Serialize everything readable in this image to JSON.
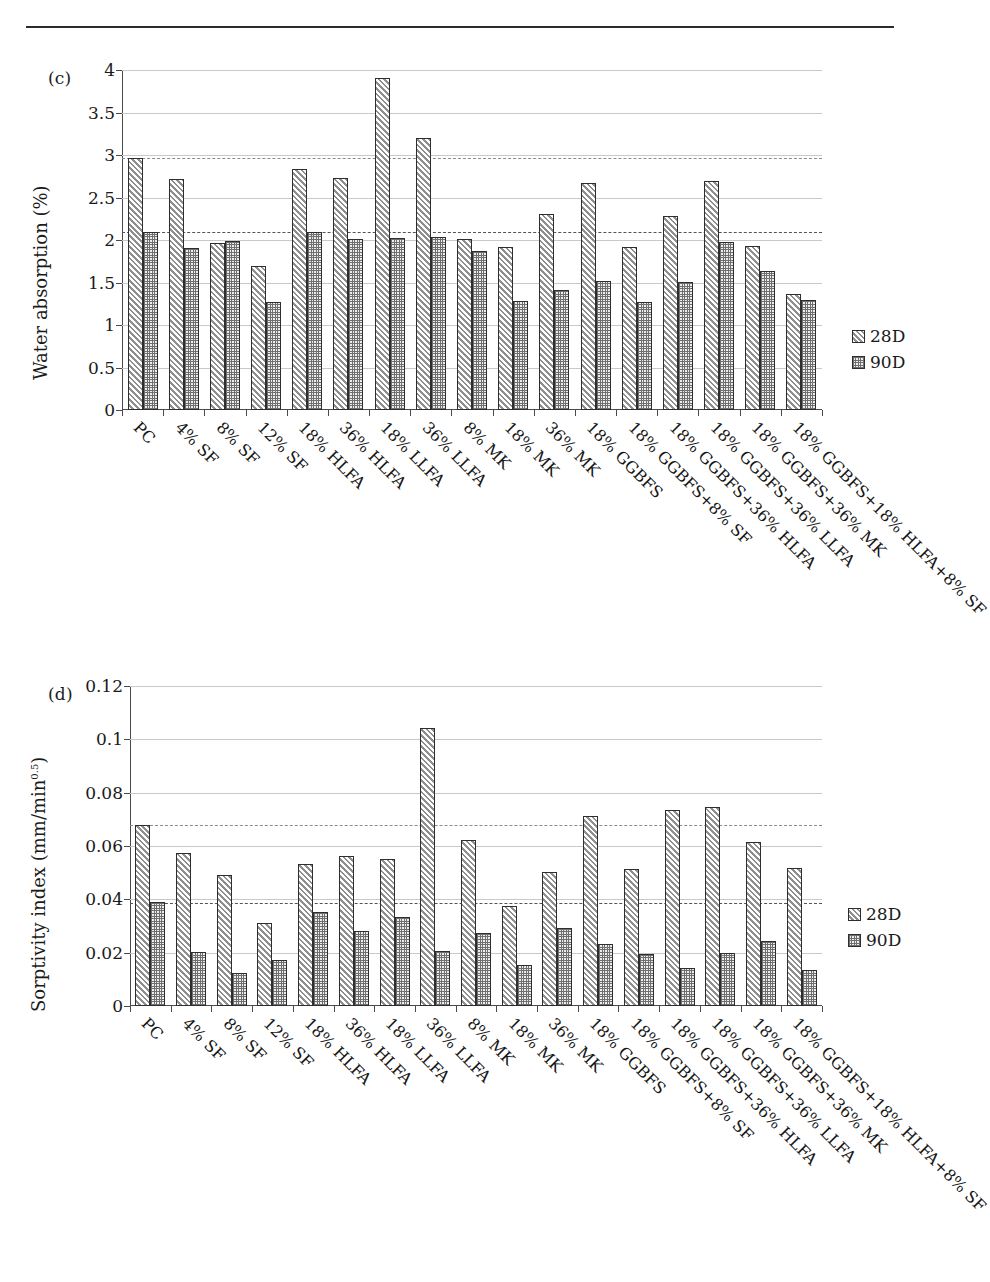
{
  "page": {
    "top_rule": "horizontal-rule"
  },
  "legend": {
    "series": [
      {
        "key": "s28",
        "label": "28D"
      },
      {
        "key": "s90",
        "label": "90D"
      }
    ]
  },
  "panel_c": {
    "tag": "(c)",
    "ylabel": "Water absorption (%)",
    "ylabel_sup": ""
  },
  "panel_d": {
    "tag": "(d)",
    "ylabel": "Sorptivity index (mm/min",
    "ylabel_sup": "0.5",
    "ylabel_tail": ")"
  },
  "chart_data": [
    {
      "panel": "(c)",
      "type": "bar",
      "title": "Water absorption (%)",
      "xlabel": "",
      "ylabel": "Water absorption (%)",
      "ylim": [
        0,
        4
      ],
      "yticks": [
        0,
        0.5,
        1,
        1.5,
        2,
        2.5,
        3,
        3.5,
        4
      ],
      "ytick_labels": [
        "0",
        "0.5",
        "1",
        "1.5",
        "2",
        "2.5",
        "3",
        "3.5",
        "4"
      ],
      "grid": true,
      "legend_position": "right",
      "reference_lines": [
        {
          "value": 2.96,
          "style": "dashed",
          "note": "PC 28D level"
        },
        {
          "value": 2.1,
          "style": "dashed",
          "note": "PC 90D level"
        }
      ],
      "categories": [
        "PC",
        "4% SF",
        "8% SF",
        "12% SF",
        "18% HLFA",
        "36% HLFA",
        "18% LLFA",
        "36% LLFA",
        "8% MK",
        "18% MK",
        "36% MK",
        "18% GGBFS",
        "18% GGBFS+8% SF",
        "18% GGBFS+36% HLFA",
        "18% GGBFS+36% LLFA",
        "18% GGBFS+36% MK",
        "18% GGBFS+18% HLFA+8% SF"
      ],
      "series": [
        {
          "name": "28D",
          "values": [
            2.96,
            2.72,
            1.97,
            1.69,
            2.83,
            2.73,
            3.91,
            3.2,
            2.01,
            1.92,
            2.31,
            2.67,
            1.92,
            2.28,
            2.7,
            1.93,
            1.37
          ]
        },
        {
          "name": "90D",
          "values": [
            2.1,
            1.91,
            1.99,
            1.27,
            2.09,
            2.01,
            2.02,
            2.04,
            1.87,
            1.28,
            1.41,
            1.52,
            1.27,
            1.51,
            1.98,
            1.64,
            1.3
          ]
        }
      ]
    },
    {
      "panel": "(d)",
      "type": "bar",
      "title": "Sorptivity index (mm/min^0.5)",
      "xlabel": "",
      "ylabel": "Sorptivity index (mm/min^0.5)",
      "ylim": [
        0,
        0.12
      ],
      "yticks": [
        0,
        0.02,
        0.04,
        0.06,
        0.08,
        0.1,
        0.12
      ],
      "ytick_labels": [
        "0",
        "0.02",
        "0.04",
        "0.06",
        "0.08",
        "0.1",
        "0.12"
      ],
      "grid": true,
      "legend_position": "right",
      "reference_lines": [
        {
          "value": 0.068,
          "style": "dashed",
          "note": "PC 28D level"
        },
        {
          "value": 0.0385,
          "style": "dashed",
          "note": "PC 90D level"
        }
      ],
      "categories": [
        "PC",
        "4% SF",
        "8% SF",
        "12% SF",
        "18% HLFA",
        "36% HLFA",
        "18% LLFA",
        "36% LLFA",
        "8% MK",
        "18% MK",
        "36% MK",
        "18% GGBFS",
        "18% GGBFS+8% SF",
        "18% GGBFS+36% HLFA",
        "18% GGBFS+36% LLFA",
        "18% GGBFS+36% MK",
        "18% GGBFS+18% HLFA+8% SF"
      ],
      "series": [
        {
          "name": "28D",
          "values": [
            0.068,
            0.0573,
            0.049,
            0.0312,
            0.0531,
            0.0561,
            0.0553,
            0.1043,
            0.0622,
            0.0374,
            0.0504,
            0.0714,
            0.0515,
            0.0735,
            0.0747,
            0.0615,
            0.0516
          ]
        },
        {
          "name": "90D",
          "values": [
            0.039,
            0.0204,
            0.0124,
            0.0173,
            0.0351,
            0.0281,
            0.0333,
            0.0205,
            0.0273,
            0.0152,
            0.0292,
            0.0233,
            0.0196,
            0.0144,
            0.0199,
            0.0244,
            0.0135
          ]
        }
      ]
    }
  ]
}
